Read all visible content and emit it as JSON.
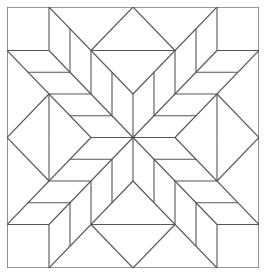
{
  "figure": {
    "grid": 6,
    "colors": {
      "background": "#ffffff",
      "line": "#555555",
      "border": "#777777"
    },
    "quadrant_segments": [
      [
        1,
        0,
        1,
        1
      ],
      [
        0,
        1,
        1,
        1
      ],
      [
        1,
        0,
        3,
        2
      ],
      [
        1,
        1,
        3,
        3
      ],
      [
        0,
        1,
        2,
        3
      ],
      [
        1.5,
        0.5,
        1.5,
        1.5
      ],
      [
        0.5,
        1.5,
        1.5,
        1.5
      ],
      [
        2,
        1,
        2,
        2
      ],
      [
        1,
        2,
        2,
        2
      ],
      [
        2.5,
        1.5,
        2.5,
        2.5
      ],
      [
        1.5,
        2.5,
        2.5,
        2.5
      ],
      [
        2,
        1,
        3,
        0
      ],
      [
        2,
        1,
        3,
        1
      ],
      [
        1,
        2,
        0,
        3
      ],
      [
        1,
        2,
        1,
        3
      ],
      [
        3,
        2,
        3,
        3
      ],
      [
        2,
        3,
        3,
        3
      ]
    ]
  }
}
